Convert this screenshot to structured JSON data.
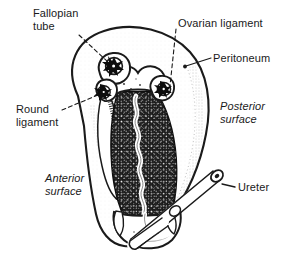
{
  "figure": {
    "background_color": "#ffffff",
    "ink_color": "#1a1a1a"
  },
  "labels": {
    "fallopian_tube": "Fallopian\ntube",
    "ovarian_ligament": "Ovarian ligament",
    "peritoneum": "Peritoneum",
    "posterior_surface": "Posterior\nsurface",
    "round_ligament": "Round\nligament",
    "anterior_surface": "Anterior\nsurface",
    "ureter": "Ureter"
  },
  "structures": [
    {
      "name": "peritoneum-broad-ligament",
      "kind": "outline"
    },
    {
      "name": "uterus-body",
      "kind": "organ"
    },
    {
      "name": "uterine-cavity",
      "kind": "lumen"
    },
    {
      "name": "cervix",
      "kind": "organ"
    },
    {
      "name": "vaginal-fornix",
      "kind": "organ"
    },
    {
      "name": "fallopian-tube-cut-end",
      "kind": "cut-section"
    },
    {
      "name": "ovarian-ligament-cut-end",
      "kind": "cut-section"
    },
    {
      "name": "round-ligament-cut-end",
      "kind": "cut-section"
    },
    {
      "name": "ureter-tube",
      "kind": "tube"
    },
    {
      "name": "ureter-cut-lumen",
      "kind": "cut-section"
    }
  ]
}
